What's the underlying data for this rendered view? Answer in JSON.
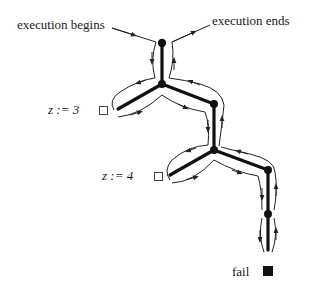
{
  "diagram": {
    "type": "execution search tree",
    "labels": {
      "begin": "execution begins",
      "end": "execution ends",
      "choice1": "z := 3",
      "choice2": "z := 4",
      "fail": "fail"
    },
    "markers": {
      "choice1": "open-square",
      "choice2": "open-square",
      "fail": "filled-square"
    },
    "nodes": [
      {
        "id": "n1",
        "x": 162,
        "y": 43
      },
      {
        "id": "n2",
        "x": 162,
        "y": 84
      },
      {
        "id": "n3",
        "x": 214,
        "y": 104
      },
      {
        "id": "n4",
        "x": 214,
        "y": 150
      },
      {
        "id": "n5",
        "x": 268,
        "y": 170
      },
      {
        "id": "n6",
        "x": 268,
        "y": 214
      }
    ],
    "edges": [
      [
        "n1",
        "n2"
      ],
      [
        "n2",
        "leaf-z3"
      ],
      [
        "n2",
        "n3"
      ],
      [
        "n3",
        "n4"
      ],
      [
        "n4",
        "leaf-z4"
      ],
      [
        "n4",
        "n5"
      ],
      [
        "n5",
        "n6"
      ],
      [
        "n6",
        "leaf-fail"
      ]
    ],
    "colors": {
      "line": "#111111",
      "trace": "#333333",
      "background": "#ffffff"
    }
  }
}
